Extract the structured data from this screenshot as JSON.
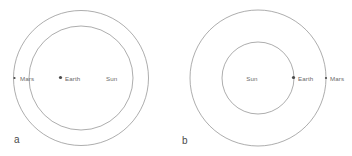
{
  "figure": {
    "width": 352,
    "height": 156,
    "background": "#ffffff",
    "orbit_stroke": "#8a8a8a",
    "label_color": "#6b6b6b",
    "panel_label_color": "#4a4a4a",
    "body_dot_color": "#4a4a4a"
  },
  "panels": [
    {
      "id": "panel-a",
      "label": "a",
      "label_x": 14,
      "label_y": 143,
      "center": {
        "x": 81,
        "y": 78
      },
      "orbits": [
        {
          "name": "mars-orbit",
          "r": 67.5
        },
        {
          "name": "earth-orbit",
          "r": 52.0
        }
      ],
      "bodies": [
        {
          "name": "mars",
          "label": "Mars",
          "dot_x": 14.5,
          "dot_y": 78,
          "dot_r": 1.1,
          "label_x": 20,
          "label_y": 80.5,
          "anchor": "start"
        },
        {
          "name": "earth",
          "label": "Earth",
          "dot_x": 60.5,
          "dot_y": 77.5,
          "dot_r": 1.6,
          "label_x": 65,
          "label_y": 80.5,
          "anchor": "start"
        },
        {
          "name": "sun",
          "label": "Sun",
          "dot_x": null,
          "dot_y": null,
          "dot_r": 0,
          "label_x": 106,
          "label_y": 80.5,
          "anchor": "start"
        }
      ]
    },
    {
      "id": "panel-b",
      "label": "b",
      "label_x": 182,
      "label_y": 144,
      "center": {
        "x": 258,
        "y": 78
      },
      "orbits": [
        {
          "name": "mars-orbit",
          "r": 68.0
        },
        {
          "name": "earth-orbit",
          "r": 36.0
        }
      ],
      "bodies": [
        {
          "name": "sun",
          "label": "Sun",
          "dot_x": null,
          "dot_y": null,
          "dot_r": 0,
          "label_x": 252,
          "label_y": 80.5,
          "anchor": "middle"
        },
        {
          "name": "earth",
          "label": "Earth",
          "dot_x": 293.5,
          "dot_y": 77.5,
          "dot_r": 1.6,
          "label_x": 298,
          "label_y": 80.5,
          "anchor": "start"
        },
        {
          "name": "mars",
          "label": "Mars",
          "dot_x": 326.0,
          "dot_y": 78,
          "dot_r": 1.1,
          "label_x": 322,
          "label_y": 80.5,
          "anchor": "start"
        }
      ]
    }
  ]
}
